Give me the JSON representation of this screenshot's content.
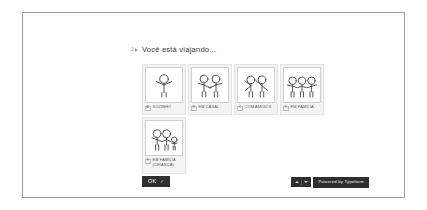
{
  "question": {
    "number": "1",
    "arrow_icon": "arrow-right-icon",
    "text": "Você está viajando..."
  },
  "options": [
    {
      "key": "A",
      "label": "SOZINHO",
      "pictogram": "single-person-icon",
      "figures": 1
    },
    {
      "key": "B",
      "label": "EM CASAL",
      "pictogram": "couple-icon",
      "figures": 2
    },
    {
      "key": "C",
      "label": "COM AMIGOS",
      "pictogram": "friends-waving-icon",
      "figures": 2
    },
    {
      "key": "D",
      "label": "EM FAMÍLIA",
      "pictogram": "family-three-icon",
      "figures": 3
    },
    {
      "key": "E",
      "label": "EM FAMÍLIA (CRIANÇA)",
      "pictogram": "family-with-child-icon",
      "figures": 3
    }
  ],
  "submit": {
    "label": "OK",
    "check_icon": "check-icon"
  },
  "branding": {
    "nav": {
      "up_icon": "chevron-up-icon",
      "down_icon": "chevron-down-icon"
    },
    "powered_label": "Powered by Typeform"
  },
  "colors": {
    "frame_border": "#9a9a9a",
    "card_bg": "#f3f3f3",
    "button_bg": "#2f2f2f",
    "text": "#3b3b3b"
  }
}
